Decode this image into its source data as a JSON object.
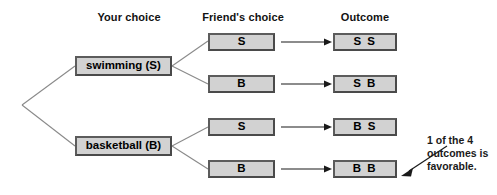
{
  "diagram": {
    "headers": [
      {
        "id": "your-choice",
        "label": "Your choice"
      },
      {
        "id": "friends-choice",
        "label": "Friend's choice"
      },
      {
        "id": "outcome",
        "label": "Outcome"
      }
    ],
    "your_choices": [
      {
        "id": "swimming",
        "label": "swimming (S)"
      },
      {
        "id": "basketball",
        "label": "basketball (B)"
      }
    ],
    "friend_choices": [
      {
        "id": "f-s-1",
        "label": "S"
      },
      {
        "id": "f-b-1",
        "label": "B"
      },
      {
        "id": "f-s-2",
        "label": "S"
      },
      {
        "id": "f-b-2",
        "label": "B"
      }
    ],
    "outcomes": [
      {
        "id": "ss",
        "label": "S S"
      },
      {
        "id": "sb",
        "label": "S B"
      },
      {
        "id": "bs",
        "label": "B S"
      },
      {
        "id": "bb",
        "label": "B B"
      }
    ],
    "annotation": {
      "line1": "1 of the 4",
      "line2": "outcomes is",
      "line3": "favorable.",
      "points_to": "bb"
    },
    "colors": {
      "box_fill": "#d2d2d2",
      "box_border": "#4a4a4a",
      "branch_line": "#8a8a8a",
      "arrow": "#1a1a1a",
      "text": "#000000",
      "background": "#ffffff"
    }
  }
}
